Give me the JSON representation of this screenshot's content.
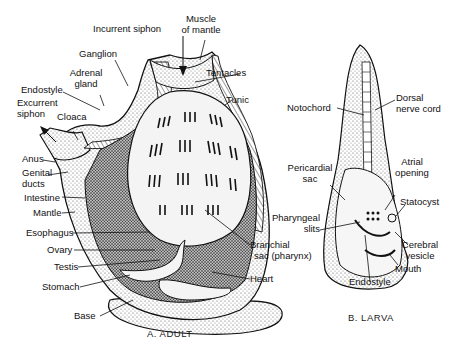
{
  "figure": {
    "adult": {
      "caption": "A. ADULT",
      "labels": {
        "incurrent_siphon": "Incurrent siphon",
        "muscle_of_mantle_1": "Muscle",
        "muscle_of_mantle_2": "of mantle",
        "ganglion": "Ganglion",
        "adrenal_gland_1": "Adrenal",
        "adrenal_gland_2": "gland",
        "tentacles": "Tentacles",
        "endostyle": "Endostyle",
        "tunic": "Tunic",
        "excurrent_siphon_1": "Excurrent",
        "excurrent_siphon_2": "siphon",
        "cloaca": "Cloaca",
        "anus": "Anus",
        "genital_ducts_1": "Genital",
        "genital_ducts_2": "ducts",
        "intestine": "Intestine",
        "mantle": "Mantle",
        "esophagus": "Esophagus",
        "ovary": "Ovary",
        "testis": "Testis",
        "stomach": "Stomach",
        "base": "Base",
        "branchial_sac_1": "Branchial",
        "branchial_sac_2": "sac (pharynx)",
        "heart": "Heart"
      }
    },
    "larva": {
      "caption": "B. LARVA",
      "labels": {
        "notochord": "Notochord",
        "dorsal_nerve_cord_1": "Dorsal",
        "dorsal_nerve_cord_2": "nerve cord",
        "pericardial_sac_1": "Pericardial",
        "pericardial_sac_2": "sac",
        "atrial_opening_1": "Atrial",
        "atrial_opening_2": "opening",
        "statocyst": "Statocyst",
        "pharyngeal_slits_1": "Pharyngeal",
        "pharyngeal_slits_2": "slits",
        "cerebral_vesicle_1": "Cerebral",
        "cerebral_vesicle_2": "vesicle",
        "mouth": "Mouth",
        "endostyle": "Endostyle"
      }
    }
  }
}
